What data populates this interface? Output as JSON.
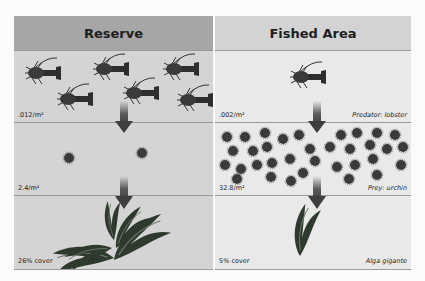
{
  "panels": {
    "reserve": {
      "title": "Reserve",
      "lobster_density": ".012/m²",
      "urchin_density": "2.4/m²",
      "kelp_cover": "26% cover"
    },
    "fished": {
      "title": "Fished Area",
      "lobster_density": ".002/m²",
      "lobster_caption": "Predator: lobster",
      "urchin_density": "32.8/m²",
      "urchin_caption": "Prey: urchin",
      "kelp_cover": "5% cover",
      "kelp_caption": "Alga gigante"
    }
  },
  "colors": {
    "reserve_header": "#a6a6a6",
    "fished_header": "#d3d3d3",
    "arrow": "#4a4a4a",
    "organism": "#333333"
  }
}
